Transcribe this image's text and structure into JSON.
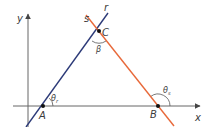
{
  "diagram": {
    "axes": {
      "x_label": "x",
      "y_label": "y",
      "color": "#555555"
    },
    "lines": [
      {
        "name": "r",
        "label": "r",
        "color": "#2c3a78"
      },
      {
        "name": "s",
        "label": "s",
        "color": "#e8693a"
      }
    ],
    "points": [
      {
        "name": "A",
        "label": "A"
      },
      {
        "name": "B",
        "label": "B"
      },
      {
        "name": "C",
        "label": "C"
      }
    ],
    "angles": {
      "theta_r": {
        "symbol": "θ",
        "subscript": "r"
      },
      "theta_s": {
        "symbol": "θ",
        "subscript": "s"
      },
      "beta": {
        "symbol": "β"
      }
    }
  }
}
